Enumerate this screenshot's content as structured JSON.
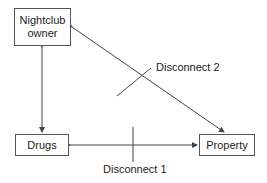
{
  "nodes": {
    "nightclub_owner": {
      "line1": "Nightclub",
      "line2": "owner"
    },
    "drugs": {
      "label": "Drugs"
    },
    "property": {
      "label": "Property"
    }
  },
  "labels": {
    "disconnect_1": "Disconnect 1",
    "disconnect_2": "Disconnect 2"
  },
  "edges": [
    {
      "from": "nightclub_owner",
      "to": "drugs",
      "type": "bidirectional"
    },
    {
      "from": "drugs",
      "to": "property",
      "type": "bidirectional",
      "label": "Disconnect 1"
    },
    {
      "from": "nightclub_owner",
      "to": "property",
      "type": "bidirectional",
      "label": "Disconnect 2"
    }
  ],
  "colors": {
    "line": "#444444",
    "border": "#555555"
  }
}
